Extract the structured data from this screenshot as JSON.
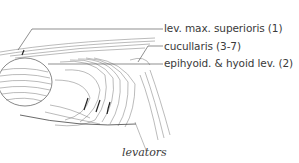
{
  "figure": {
    "caption": "levators",
    "labels": [
      {
        "id": 1,
        "text": "lev. max. superioris (1)"
      },
      {
        "id": 2,
        "text": "cucullaris (3-7)"
      },
      {
        "id": 3,
        "text": "epihyoid. & hyoid lev. (2)"
      }
    ],
    "colors": {
      "ink": "#3a3a3a",
      "line": "#555555",
      "background": "#ffffff"
    }
  }
}
